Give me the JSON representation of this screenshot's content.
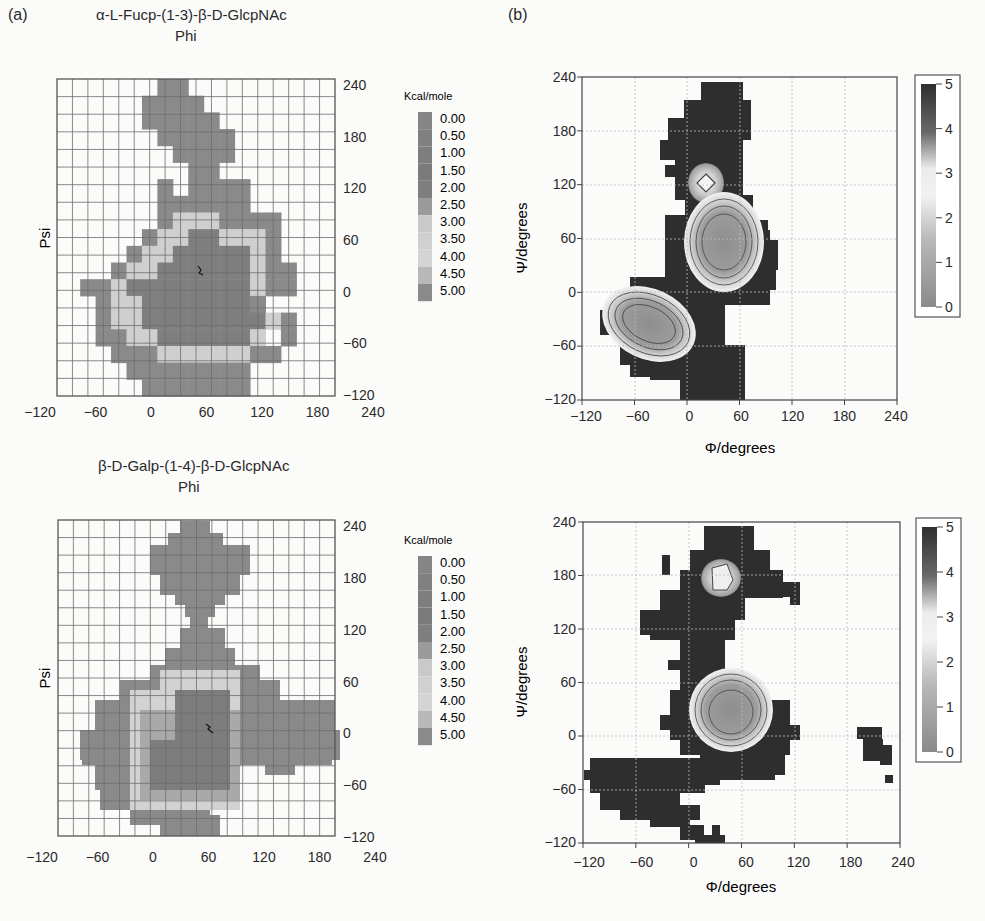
{
  "panels": {
    "a_label": "(a)",
    "b_label": "(b)"
  },
  "chart_data": [
    {
      "id": "a-top",
      "type": "heatmap",
      "title": "α-L-Fucp-(1-3)-β-D-GlcpNAc",
      "xlabel": "Phi",
      "ylabel": "Psi",
      "xlim": [
        -120,
        240
      ],
      "ylim": [
        -120,
        240
      ],
      "x_ticks": [
        "-120",
        "-60",
        "0",
        "60",
        "120",
        "180",
        "240"
      ],
      "y_ticks": [
        "240",
        "180",
        "120",
        "60",
        "0",
        "-60",
        "-120"
      ],
      "grid": "20° cells",
      "legend_title": "Kcal/mole",
      "legend_levels": [
        "0.00",
        "0.50",
        "1.00",
        "1.50",
        "2.00",
        "2.50",
        "3.00",
        "3.50",
        "4.00",
        "4.50",
        "5.00"
      ],
      "minimum_marker": {
        "phi": 40,
        "psi": 10
      },
      "cells_note": "rows top(psi 240) to bottom(psi -120), 18x18; '.'=empty, 0-4 energy shade bands (0 lowest)",
      "cells": [
        "......44.........",
        ".....4444........",
        ".....44444.......",
        "......44444......",
        ".......4444......",
        "........44.......",
        "......4.4444.....",
        "......444444.....",
        "......43334444...",
        ".....433223334...",
        "....4332222234...",
        "...433222222344..",
        ".44322222222344..",
        "..43322222224....",
        "..4332222222234..",
        "..44332222223.4..",
        "...44433333344...",
        "....44444444.....",
        ".....4444444....."
      ]
    },
    {
      "id": "b-top",
      "type": "heatmap",
      "xlabel": "Φ/degrees",
      "ylabel": "Ψ/degrees",
      "xlim": [
        -120,
        240
      ],
      "ylim": [
        -120,
        240
      ],
      "x_ticks": [
        "-120",
        "-60",
        "0",
        "60",
        "120",
        "180",
        "240"
      ],
      "y_ticks": [
        "240",
        "180",
        "120",
        "60",
        "0",
        "-60",
        "-120"
      ],
      "colorbar_ticks": [
        "5",
        "4",
        "3",
        "2",
        "1",
        "0"
      ],
      "colorbar_range": [
        0,
        5
      ],
      "minima": [
        {
          "phi": 20,
          "psi": 170,
          "energy": 2.5
        },
        {
          "phi": 35,
          "psi": 40,
          "energy": 0.5
        },
        {
          "phi": -30,
          "psi": -45,
          "energy": 0.5
        }
      ]
    },
    {
      "id": "a-bottom",
      "type": "heatmap",
      "title": "β-D-Galp-(1-4)-β-D-GlcpNAc",
      "xlabel": "Phi",
      "ylabel": "Psi",
      "xlim": [
        -120,
        240
      ],
      "ylim": [
        -120,
        240
      ],
      "x_ticks": [
        "-120",
        "-60",
        "0",
        "60",
        "120",
        "180",
        "240"
      ],
      "y_ticks": [
        "240",
        "180",
        "120",
        "60",
        "0",
        "-60",
        "-120"
      ],
      "legend_title": "Kcal/mole",
      "legend_levels": [
        "0.00",
        "0.50",
        "1.00",
        "1.50",
        "2.00",
        "2.50",
        "3.00",
        "3.50",
        "4.00",
        "4.50",
        "5.00"
      ],
      "minimum_marker": {
        "phi": 55,
        "psi": 5
      }
    },
    {
      "id": "b-bottom",
      "type": "heatmap",
      "xlabel": "Φ/degrees",
      "ylabel": "Ψ/degrees",
      "xlim": [
        -120,
        240
      ],
      "ylim": [
        -120,
        240
      ],
      "x_ticks": [
        "-120",
        "-60",
        "0",
        "60",
        "120",
        "180",
        "240"
      ],
      "y_ticks": [
        "240",
        "180",
        "120",
        "60",
        "0",
        "-60",
        "-120"
      ],
      "colorbar_ticks": [
        "5",
        "4",
        "3",
        "2",
        "1",
        "0"
      ],
      "colorbar_range": [
        0,
        5
      ],
      "minima": [
        {
          "phi": 50,
          "psi": 195,
          "energy": 2.5
        },
        {
          "phi": 45,
          "psi": 30,
          "energy": 0.5
        }
      ]
    }
  ],
  "colors": {
    "band_dark": "#7d7d7d",
    "band_mid": "#a9a9a9",
    "band_light": "#d2d2d2",
    "band_outer": "#8a8a8a",
    "b_dark": "#2e2e2e",
    "grid": "#777777",
    "bg": "#fbfbfa"
  }
}
